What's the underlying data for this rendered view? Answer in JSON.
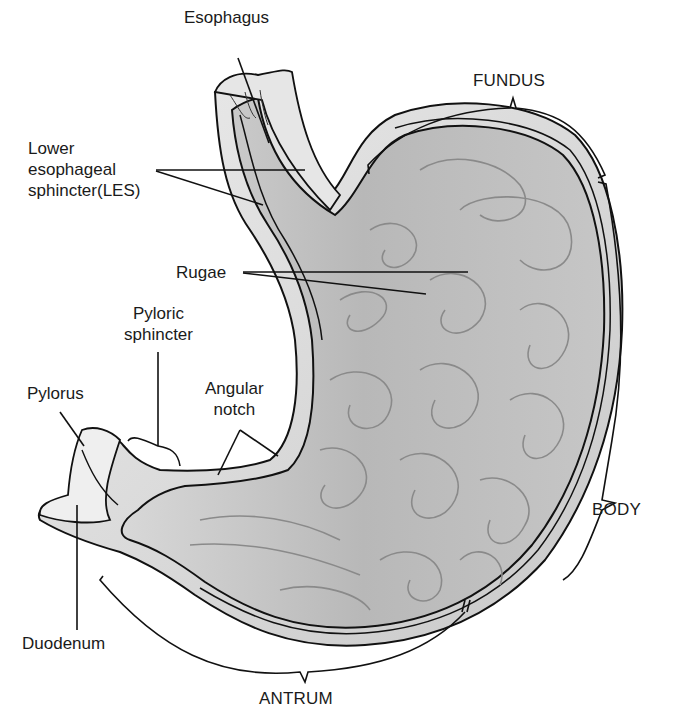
{
  "figure": {
    "colors": {
      "background": "#ffffff",
      "stomach_fill": "#bdbdbd",
      "wall_fill": "#d6d6d6",
      "outline": "#111111",
      "rugae": "#8a8a8a"
    }
  },
  "labels": {
    "esophagus": "Esophagus",
    "les": [
      "Lower",
      "esophageal",
      "sphincter(LES)"
    ],
    "rugae": "Rugae",
    "pyloric_sphincter": [
      "Pyloric",
      "sphincter"
    ],
    "pylorus": "Pylorus",
    "angular_notch": [
      "Angular",
      "notch"
    ],
    "duodenum": "Duodenum",
    "fundus": "FUNDUS",
    "body": "BODY",
    "antrum": "ANTRUM"
  }
}
